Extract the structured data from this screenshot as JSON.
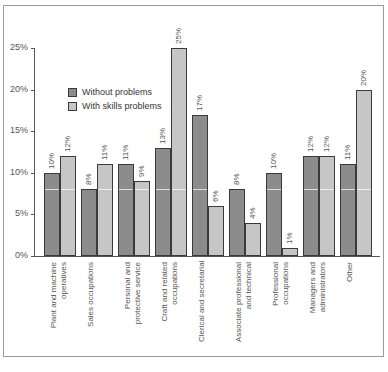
{
  "chart_data": {
    "type": "bar",
    "title": "",
    "xlabel": "",
    "ylabel": "",
    "ylim": [
      0,
      25
    ],
    "yticks": [
      "0%",
      "5%",
      "10%",
      "15%",
      "20%",
      "25%"
    ],
    "grid": false,
    "legend_position": "upper left (inside plot)",
    "categories": [
      "Plant and machine operatives",
      "Sales occupations",
      "Personal and protective service",
      "Craft and related occupations",
      "Clerical and secretarial",
      "Associate professional and technical",
      "Professional occupations",
      "Managers and administrators",
      "Other"
    ],
    "category_lines": [
      "Plant and machine\noperatives",
      "Sales occupations",
      "Personal and\nprotective service",
      "Craft and related\noccupations",
      "Clerical and secretarial",
      "Associate professional\nand technical",
      "Professional\noccupations",
      "Managers and\nadministrators",
      "Other"
    ],
    "series": [
      {
        "name": "Without problems",
        "color": "#8c8c8c",
        "values": [
          10,
          8,
          11,
          13,
          17,
          8,
          10,
          12,
          11
        ],
        "labels": [
          "10%",
          "8%",
          "11%",
          "13%",
          "17%",
          "8%",
          "10%",
          "12%",
          "11%"
        ]
      },
      {
        "name": "With skills problems",
        "color": "#c6c6c6",
        "values": [
          12,
          11,
          9,
          25,
          6,
          4,
          1,
          12,
          20
        ],
        "labels": [
          "12%",
          "11%",
          "9%",
          "25%",
          "6%",
          "4%",
          "1%",
          "12%",
          "20%"
        ]
      }
    ]
  },
  "legend": {
    "without": "Without problems",
    "with": "With skills problems"
  },
  "source": "Source: ..."
}
